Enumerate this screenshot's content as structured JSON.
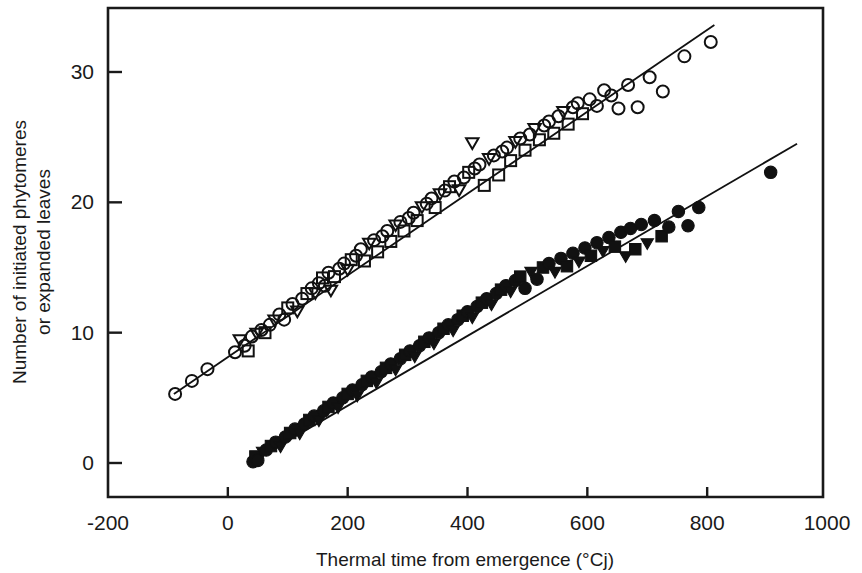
{
  "figure": {
    "background": "#ffffff",
    "ink_color": "#111111"
  },
  "chart_data": {
    "type": "scatter",
    "title": "",
    "subtitle": "",
    "xlabel": "Thermal time from emergence (°Cj)",
    "ylabel": "Number of initiated phytomeres\nor expanded leaves",
    "ylabel_line1": "Number of initiated phytomeres",
    "ylabel_line2": "or expanded leaves",
    "xlim": [
      -200,
      1000
    ],
    "ylim": [
      -3,
      37
    ],
    "xticks": [
      -200,
      0,
      200,
      400,
      600,
      800,
      1000
    ],
    "xticklabels": [
      "-200",
      "0",
      "200",
      "400",
      "600",
      "800",
      "1000"
    ],
    "yticks": [
      0,
      10,
      20,
      30
    ],
    "yticklabels": [
      "0",
      "10",
      "20",
      "30"
    ],
    "grid": false,
    "legend": "none",
    "frame": "full-box",
    "annotations": [],
    "series": [
      {
        "name": "initiated phytomeres",
        "marker": "open",
        "marker_shapes": [
          "circle",
          "square",
          "triangle-down"
        ],
        "fit_line": {
          "x": [
            -90,
            812
          ],
          "y": [
            5.3,
            33.6
          ],
          "slope": 0.0314,
          "intercept": 8.13
        },
        "points": [
          {
            "x": -88,
            "y": 5.3,
            "m": "circle"
          },
          {
            "x": -60,
            "y": 6.3,
            "m": "circle"
          },
          {
            "x": -34,
            "y": 7.2,
            "m": "circle"
          },
          {
            "x": 12,
            "y": 8.5,
            "m": "circle"
          },
          {
            "x": 20,
            "y": 9.4,
            "m": "triangle-down"
          },
          {
            "x": 28,
            "y": 9.0,
            "m": "circle"
          },
          {
            "x": 34,
            "y": 8.6,
            "m": "square"
          },
          {
            "x": 40,
            "y": 9.7,
            "m": "circle"
          },
          {
            "x": 48,
            "y": 9.9,
            "m": "triangle-down"
          },
          {
            "x": 56,
            "y": 10.2,
            "m": "circle"
          },
          {
            "x": 62,
            "y": 10.0,
            "m": "square"
          },
          {
            "x": 70,
            "y": 10.6,
            "m": "circle"
          },
          {
            "x": 78,
            "y": 10.9,
            "m": "triangle-down"
          },
          {
            "x": 86,
            "y": 11.4,
            "m": "circle"
          },
          {
            "x": 94,
            "y": 11.0,
            "m": "circle"
          },
          {
            "x": 100,
            "y": 11.9,
            "m": "square"
          },
          {
            "x": 108,
            "y": 12.2,
            "m": "circle"
          },
          {
            "x": 116,
            "y": 11.6,
            "m": "triangle-down"
          },
          {
            "x": 124,
            "y": 12.6,
            "m": "circle"
          },
          {
            "x": 132,
            "y": 13.0,
            "m": "square"
          },
          {
            "x": 140,
            "y": 13.4,
            "m": "circle"
          },
          {
            "x": 146,
            "y": 13.0,
            "m": "triangle-down"
          },
          {
            "x": 152,
            "y": 13.8,
            "m": "circle"
          },
          {
            "x": 158,
            "y": 14.2,
            "m": "square"
          },
          {
            "x": 162,
            "y": 13.6,
            "m": "circle"
          },
          {
            "x": 168,
            "y": 14.6,
            "m": "circle"
          },
          {
            "x": 172,
            "y": 13.2,
            "m": "triangle-down"
          },
          {
            "x": 178,
            "y": 14.3,
            "m": "square"
          },
          {
            "x": 186,
            "y": 14.9,
            "m": "circle"
          },
          {
            "x": 194,
            "y": 15.3,
            "m": "circle"
          },
          {
            "x": 200,
            "y": 14.8,
            "m": "triangle-down"
          },
          {
            "x": 206,
            "y": 15.6,
            "m": "square"
          },
          {
            "x": 214,
            "y": 15.9,
            "m": "circle"
          },
          {
            "x": 222,
            "y": 16.4,
            "m": "circle"
          },
          {
            "x": 228,
            "y": 15.5,
            "m": "square"
          },
          {
            "x": 236,
            "y": 16.8,
            "m": "triangle-down"
          },
          {
            "x": 244,
            "y": 17.1,
            "m": "circle"
          },
          {
            "x": 250,
            "y": 16.2,
            "m": "square"
          },
          {
            "x": 258,
            "y": 17.4,
            "m": "circle"
          },
          {
            "x": 266,
            "y": 17.8,
            "m": "circle"
          },
          {
            "x": 272,
            "y": 17.0,
            "m": "square"
          },
          {
            "x": 280,
            "y": 18.2,
            "m": "triangle-down"
          },
          {
            "x": 288,
            "y": 18.5,
            "m": "circle"
          },
          {
            "x": 294,
            "y": 17.8,
            "m": "square"
          },
          {
            "x": 302,
            "y": 18.8,
            "m": "circle"
          },
          {
            "x": 310,
            "y": 19.2,
            "m": "circle"
          },
          {
            "x": 316,
            "y": 18.6,
            "m": "square"
          },
          {
            "x": 324,
            "y": 19.6,
            "m": "triangle-down"
          },
          {
            "x": 332,
            "y": 19.9,
            "m": "circle"
          },
          {
            "x": 340,
            "y": 20.3,
            "m": "circle"
          },
          {
            "x": 346,
            "y": 19.6,
            "m": "square"
          },
          {
            "x": 354,
            "y": 20.6,
            "m": "triangle-down"
          },
          {
            "x": 362,
            "y": 20.9,
            "m": "circle"
          },
          {
            "x": 370,
            "y": 21.2,
            "m": "square"
          },
          {
            "x": 378,
            "y": 21.6,
            "m": "circle"
          },
          {
            "x": 386,
            "y": 20.9,
            "m": "triangle-down"
          },
          {
            "x": 394,
            "y": 21.9,
            "m": "circle"
          },
          {
            "x": 402,
            "y": 22.3,
            "m": "square"
          },
          {
            "x": 408,
            "y": 24.5,
            "m": "triangle-down"
          },
          {
            "x": 412,
            "y": 22.6,
            "m": "circle"
          },
          {
            "x": 420,
            "y": 22.9,
            "m": "circle"
          },
          {
            "x": 428,
            "y": 21.3,
            "m": "square"
          },
          {
            "x": 436,
            "y": 23.3,
            "m": "triangle-down"
          },
          {
            "x": 444,
            "y": 23.6,
            "m": "circle"
          },
          {
            "x": 452,
            "y": 22.1,
            "m": "square"
          },
          {
            "x": 458,
            "y": 23.9,
            "m": "circle"
          },
          {
            "x": 466,
            "y": 24.2,
            "m": "circle"
          },
          {
            "x": 472,
            "y": 23.2,
            "m": "square"
          },
          {
            "x": 480,
            "y": 24.6,
            "m": "triangle-down"
          },
          {
            "x": 488,
            "y": 24.9,
            "m": "circle"
          },
          {
            "x": 496,
            "y": 24.0,
            "m": "square"
          },
          {
            "x": 504,
            "y": 25.2,
            "m": "circle"
          },
          {
            "x": 512,
            "y": 25.6,
            "m": "triangle-down"
          },
          {
            "x": 520,
            "y": 24.8,
            "m": "square"
          },
          {
            "x": 528,
            "y": 25.9,
            "m": "circle"
          },
          {
            "x": 536,
            "y": 26.2,
            "m": "circle"
          },
          {
            "x": 544,
            "y": 25.3,
            "m": "square"
          },
          {
            "x": 552,
            "y": 26.6,
            "m": "circle"
          },
          {
            "x": 560,
            "y": 26.9,
            "m": "triangle-down"
          },
          {
            "x": 568,
            "y": 26.0,
            "m": "square"
          },
          {
            "x": 576,
            "y": 27.3,
            "m": "circle"
          },
          {
            "x": 584,
            "y": 27.6,
            "m": "circle"
          },
          {
            "x": 592,
            "y": 26.8,
            "m": "square"
          },
          {
            "x": 604,
            "y": 27.9,
            "m": "circle"
          },
          {
            "x": 616,
            "y": 27.4,
            "m": "circle"
          },
          {
            "x": 628,
            "y": 28.6,
            "m": "circle"
          },
          {
            "x": 640,
            "y": 28.2,
            "m": "circle"
          },
          {
            "x": 652,
            "y": 27.2,
            "m": "circle"
          },
          {
            "x": 668,
            "y": 29.0,
            "m": "circle"
          },
          {
            "x": 684,
            "y": 27.3,
            "m": "circle"
          },
          {
            "x": 704,
            "y": 29.6,
            "m": "circle"
          },
          {
            "x": 726,
            "y": 28.5,
            "m": "circle"
          },
          {
            "x": 762,
            "y": 31.2,
            "m": "circle"
          },
          {
            "x": 806,
            "y": 32.3,
            "m": "circle"
          }
        ]
      },
      {
        "name": "expanded leaves",
        "marker": "filled",
        "marker_shapes": [
          "circle",
          "square",
          "triangle-down"
        ],
        "fit_line": {
          "x": [
            40,
            950
          ],
          "y": [
            0.1,
            24.5
          ],
          "slope": 0.0268,
          "intercept": -0.97
        },
        "points": [
          {
            "x": 42,
            "y": 0.1,
            "m": "circle"
          },
          {
            "x": 46,
            "y": 0.5,
            "m": "square"
          },
          {
            "x": 50,
            "y": 0.2,
            "m": "circle"
          },
          {
            "x": 58,
            "y": 0.8,
            "m": "triangle-down"
          },
          {
            "x": 64,
            "y": 1.0,
            "m": "circle"
          },
          {
            "x": 72,
            "y": 1.3,
            "m": "square"
          },
          {
            "x": 80,
            "y": 1.6,
            "m": "circle"
          },
          {
            "x": 88,
            "y": 1.2,
            "m": "triangle-down"
          },
          {
            "x": 96,
            "y": 2.0,
            "m": "circle"
          },
          {
            "x": 104,
            "y": 2.3,
            "m": "square"
          },
          {
            "x": 112,
            "y": 2.6,
            "m": "circle"
          },
          {
            "x": 120,
            "y": 2.2,
            "m": "triangle-down"
          },
          {
            "x": 128,
            "y": 3.0,
            "m": "circle"
          },
          {
            "x": 136,
            "y": 3.3,
            "m": "square"
          },
          {
            "x": 144,
            "y": 3.6,
            "m": "circle"
          },
          {
            "x": 152,
            "y": 3.2,
            "m": "triangle-down"
          },
          {
            "x": 160,
            "y": 4.0,
            "m": "circle"
          },
          {
            "x": 168,
            "y": 4.3,
            "m": "square"
          },
          {
            "x": 176,
            "y": 4.6,
            "m": "circle"
          },
          {
            "x": 184,
            "y": 4.2,
            "m": "triangle-down"
          },
          {
            "x": 192,
            "y": 5.0,
            "m": "circle"
          },
          {
            "x": 200,
            "y": 5.3,
            "m": "square"
          },
          {
            "x": 208,
            "y": 5.6,
            "m": "circle"
          },
          {
            "x": 216,
            "y": 5.1,
            "m": "triangle-down"
          },
          {
            "x": 224,
            "y": 6.0,
            "m": "circle"
          },
          {
            "x": 232,
            "y": 6.3,
            "m": "square"
          },
          {
            "x": 240,
            "y": 6.6,
            "m": "circle"
          },
          {
            "x": 248,
            "y": 6.1,
            "m": "triangle-down"
          },
          {
            "x": 256,
            "y": 7.0,
            "m": "circle"
          },
          {
            "x": 264,
            "y": 7.3,
            "m": "square"
          },
          {
            "x": 272,
            "y": 7.6,
            "m": "circle"
          },
          {
            "x": 280,
            "y": 7.1,
            "m": "triangle-down"
          },
          {
            "x": 288,
            "y": 8.0,
            "m": "circle"
          },
          {
            "x": 296,
            "y": 8.3,
            "m": "square"
          },
          {
            "x": 304,
            "y": 8.6,
            "m": "circle"
          },
          {
            "x": 312,
            "y": 8.1,
            "m": "triangle-down"
          },
          {
            "x": 320,
            "y": 9.0,
            "m": "circle"
          },
          {
            "x": 328,
            "y": 9.3,
            "m": "square"
          },
          {
            "x": 336,
            "y": 9.6,
            "m": "circle"
          },
          {
            "x": 344,
            "y": 9.1,
            "m": "triangle-down"
          },
          {
            "x": 352,
            "y": 10.0,
            "m": "circle"
          },
          {
            "x": 360,
            "y": 10.3,
            "m": "square"
          },
          {
            "x": 368,
            "y": 10.6,
            "m": "circle"
          },
          {
            "x": 376,
            "y": 10.1,
            "m": "triangle-down"
          },
          {
            "x": 384,
            "y": 11.0,
            "m": "circle"
          },
          {
            "x": 392,
            "y": 11.3,
            "m": "square"
          },
          {
            "x": 400,
            "y": 11.6,
            "m": "circle"
          },
          {
            "x": 408,
            "y": 11.1,
            "m": "triangle-down"
          },
          {
            "x": 416,
            "y": 12.0,
            "m": "circle"
          },
          {
            "x": 424,
            "y": 12.3,
            "m": "square"
          },
          {
            "x": 432,
            "y": 12.6,
            "m": "circle"
          },
          {
            "x": 440,
            "y": 12.1,
            "m": "triangle-down"
          },
          {
            "x": 448,
            "y": 13.0,
            "m": "circle"
          },
          {
            "x": 456,
            "y": 13.3,
            "m": "square"
          },
          {
            "x": 464,
            "y": 13.6,
            "m": "circle"
          },
          {
            "x": 472,
            "y": 13.1,
            "m": "triangle-down"
          },
          {
            "x": 480,
            "y": 14.0,
            "m": "circle"
          },
          {
            "x": 488,
            "y": 14.3,
            "m": "square"
          },
          {
            "x": 496,
            "y": 13.4,
            "m": "circle"
          },
          {
            "x": 506,
            "y": 14.6,
            "m": "triangle-down"
          },
          {
            "x": 516,
            "y": 14.1,
            "m": "circle"
          },
          {
            "x": 526,
            "y": 15.0,
            "m": "square"
          },
          {
            "x": 536,
            "y": 15.3,
            "m": "circle"
          },
          {
            "x": 546,
            "y": 14.6,
            "m": "triangle-down"
          },
          {
            "x": 556,
            "y": 15.7,
            "m": "circle"
          },
          {
            "x": 566,
            "y": 15.1,
            "m": "square"
          },
          {
            "x": 576,
            "y": 16.1,
            "m": "circle"
          },
          {
            "x": 586,
            "y": 15.4,
            "m": "triangle-down"
          },
          {
            "x": 596,
            "y": 16.5,
            "m": "circle"
          },
          {
            "x": 606,
            "y": 15.9,
            "m": "square"
          },
          {
            "x": 616,
            "y": 16.9,
            "m": "circle"
          },
          {
            "x": 626,
            "y": 16.2,
            "m": "triangle-down"
          },
          {
            "x": 636,
            "y": 17.3,
            "m": "circle"
          },
          {
            "x": 646,
            "y": 16.6,
            "m": "square"
          },
          {
            "x": 656,
            "y": 17.7,
            "m": "circle"
          },
          {
            "x": 664,
            "y": 15.8,
            "m": "triangle-down"
          },
          {
            "x": 672,
            "y": 18.0,
            "m": "circle"
          },
          {
            "x": 680,
            "y": 16.4,
            "m": "square"
          },
          {
            "x": 690,
            "y": 18.3,
            "m": "circle"
          },
          {
            "x": 700,
            "y": 16.8,
            "m": "triangle-down"
          },
          {
            "x": 712,
            "y": 18.6,
            "m": "circle"
          },
          {
            "x": 724,
            "y": 17.4,
            "m": "square"
          },
          {
            "x": 736,
            "y": 18.1,
            "m": "circle"
          },
          {
            "x": 752,
            "y": 19.3,
            "m": "circle"
          },
          {
            "x": 768,
            "y": 18.2,
            "m": "circle"
          },
          {
            "x": 786,
            "y": 19.6,
            "m": "circle"
          },
          {
            "x": 906,
            "y": 22.3,
            "m": "circle"
          }
        ]
      }
    ]
  }
}
